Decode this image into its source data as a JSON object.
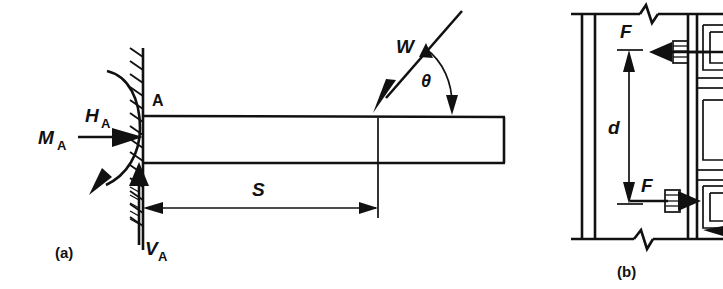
{
  "figure": {
    "type": "engineering-free-body-diagram",
    "background_color": "#ffffff",
    "line_color": "#111111",
    "width": 723,
    "height": 289
  },
  "panel_a": {
    "caption": "(a)",
    "description": "Cantilever beam fixed at wall support A with inclined point load W",
    "labels": {
      "support_point": "A",
      "moment_base": "M",
      "moment_sub": "A",
      "horizontal_base": "H",
      "horizontal_sub": "A",
      "vertical_base": "V",
      "vertical_sub": "A",
      "load": "W",
      "angle": "θ",
      "span": "S"
    },
    "elements": [
      "fixed-wall-hatching",
      "beam-outline",
      "moment-arc-arrow",
      "horizontal-reaction-arrow",
      "vertical-reaction-arrow",
      "applied-load-arrow",
      "angle-arc",
      "span-dimension-line"
    ]
  },
  "panel_b": {
    "caption": "(b)",
    "description": "Column with bolted bracket connection, couple forces F separated by distance d",
    "labels": {
      "force_top": "F",
      "force_bottom": "F",
      "distance": "d"
    },
    "elements": [
      "column-flange-lines",
      "break-symbol-top",
      "break-symbol-bottom",
      "bolt-top",
      "bolt-bottom",
      "bracket-plate",
      "force-arrow-top-left",
      "force-arrow-bottom-right",
      "distance-dimension-line"
    ]
  }
}
